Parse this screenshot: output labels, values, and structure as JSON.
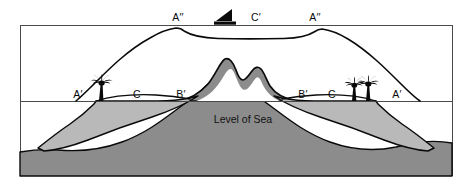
{
  "figure": {
    "title_text": "",
    "type": "geological-cross-section",
    "background_color": "#ffffff"
  },
  "labels": {
    "former_sea_level_left": "A′′",
    "former_sea_level_right": "A′′",
    "former_lagoon": "C′",
    "present_shore_left": "A′",
    "present_shore_right": "A′",
    "present_lagoon_left": "C",
    "present_lagoon_right": "C",
    "reef_crest_left": "B′",
    "reef_crest_right": "B′",
    "sea_level_caption": "Level of Sea"
  },
  "icons": {
    "sailboat": "sailboat-icon",
    "palm_tree_left": "palm-tree-icon",
    "tree_right_a": "tree-icon",
    "tree_right_b": "tree-icon"
  },
  "colors": {
    "outline": "#0a0a0a",
    "reef_light_gray": "#b9b9b9",
    "basement_dark_gray": "#8c8c8c",
    "frame_line": "#555555",
    "white": "#ffffff"
  },
  "geometry": {
    "former_sea_level_y": 25,
    "present_sea_level_y": 101,
    "frame_left_x": 20,
    "frame_right_x": 452,
    "frame_top_y": 25,
    "frame_bottom_y": 176
  }
}
